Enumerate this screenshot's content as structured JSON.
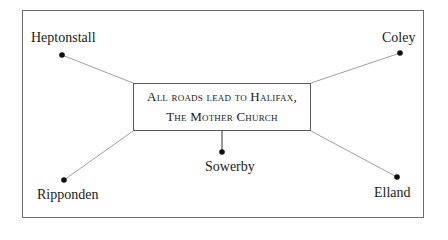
{
  "title_lines": [
    "All roads lead to Halifax,",
    "The Mother Church"
  ],
  "places": [
    {
      "id": "heptonstall",
      "label": "Heptonstall"
    },
    {
      "id": "coley",
      "label": "Coley"
    },
    {
      "id": "ripponden",
      "label": "Ripponden"
    },
    {
      "id": "sowerby",
      "label": "Sowerby"
    },
    {
      "id": "elland",
      "label": "Elland"
    }
  ],
  "colors": {
    "line": "#9a9a9a",
    "dot": "#111111",
    "border": "#6a6a6a"
  }
}
